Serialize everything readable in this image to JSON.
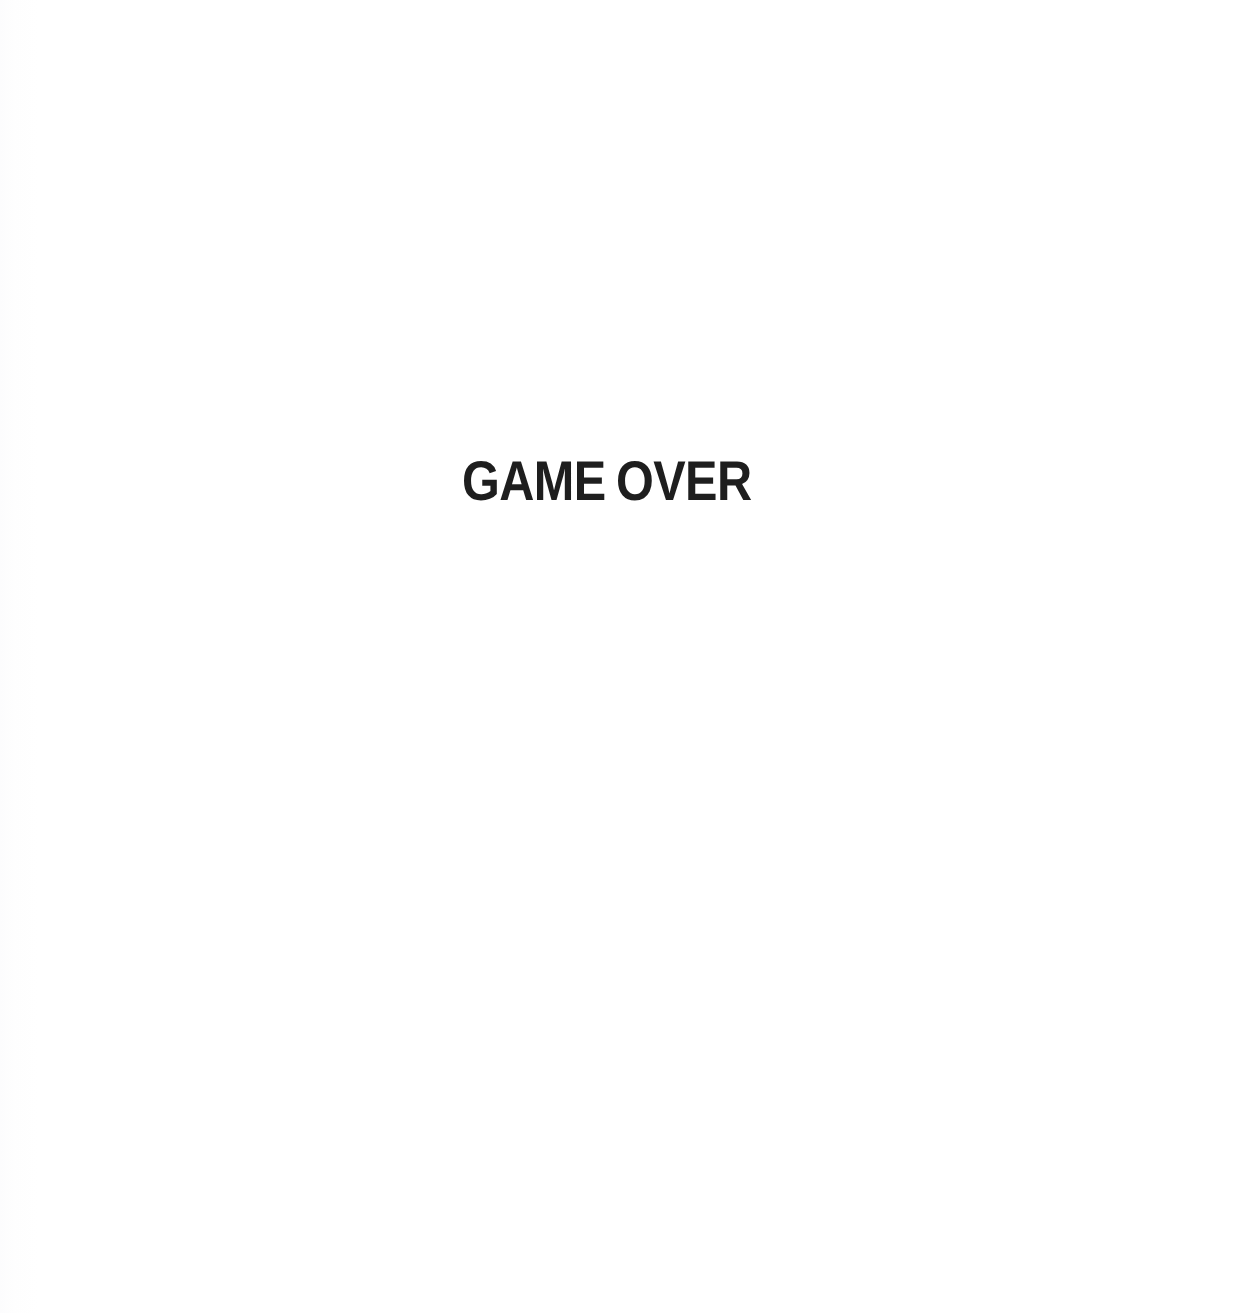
{
  "page": {
    "background_color": "#ffffff",
    "width": 1238,
    "height": 1313
  },
  "message": {
    "text": "GAME OVER",
    "color": "#1e1e1e"
  }
}
